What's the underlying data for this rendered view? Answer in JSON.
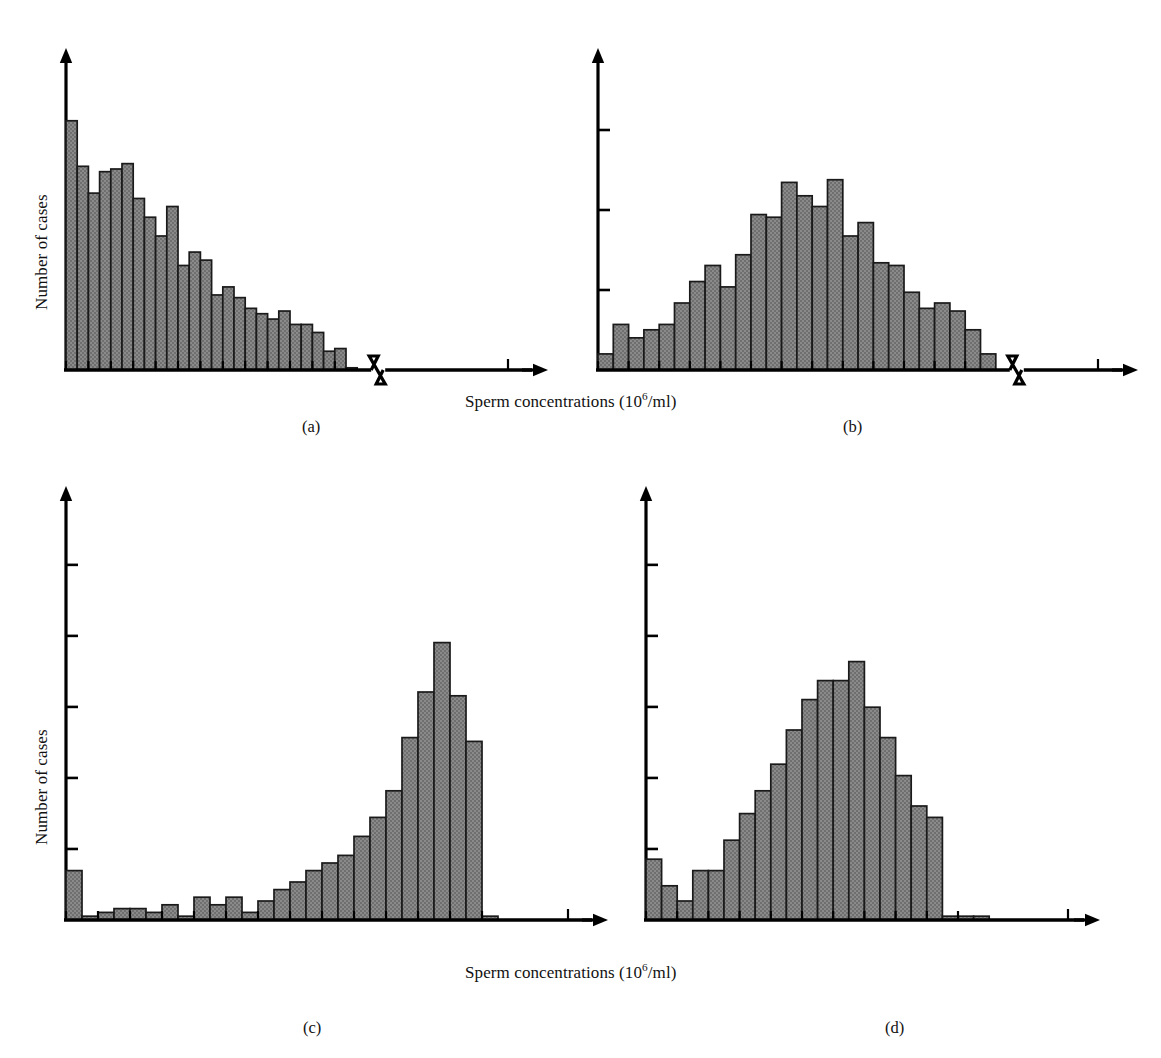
{
  "figure": {
    "axis_x_label_plain": "Sperm concentrations (10^6/ml)",
    "axis_x_label_main": "Sperm concentrations (10",
    "axis_x_label_sup": "6",
    "axis_x_label_tail": "/ml)",
    "axis_y_label": "Number of cases",
    "bar_fill_color": "#808080",
    "bar_edge_color": "#1a1a1a",
    "axis_color": "#000000",
    "background_color": "#ffffff"
  },
  "captions": {
    "a": "(a)",
    "b": "(b)",
    "c": "(c)",
    "d": "(d)"
  },
  "chart_data": [
    {
      "type": "bar",
      "panel": "a",
      "title": "",
      "xlabel": "Sperm concentrations (10^6/ml)",
      "ylabel": "Number of cases",
      "grid": false,
      "legend": "none",
      "axis_break": true,
      "n_bins": 26,
      "y_ticks_count": 3,
      "ylim": [
        0,
        100
      ],
      "description": "Right-skewed (positively skewed) distribution of sperm concentrations",
      "values": [
        93,
        76,
        66,
        74,
        75,
        77,
        64,
        57,
        50,
        61,
        39,
        44,
        41,
        28,
        31,
        27,
        23,
        21,
        19,
        22,
        17,
        17,
        14,
        7,
        8,
        0
      ]
    },
    {
      "type": "bar",
      "panel": "b",
      "title": "",
      "xlabel": "Sperm concentrations (10^6/ml)",
      "ylabel": "",
      "grid": false,
      "legend": "none",
      "axis_break": true,
      "n_bins": 26,
      "y_ticks_count": 3,
      "ylim": [
        0,
        100
      ],
      "description": "Approximately symmetric bell-shaped distribution after transformation",
      "values": [
        6,
        17,
        12,
        15,
        17,
        25,
        33,
        39,
        31,
        43,
        58,
        57,
        70,
        65,
        61,
        71,
        50,
        55,
        40,
        39,
        29,
        23,
        25,
        22,
        15,
        6
      ]
    },
    {
      "type": "bar",
      "panel": "c",
      "title": "",
      "xlabel": "Sperm concentrations (10^6/ml)",
      "ylabel": "Number of cases",
      "grid": false,
      "legend": "none",
      "axis_break": false,
      "n_bins": 27,
      "y_ticks_count": 5,
      "ylim": [
        0,
        100
      ],
      "description": "Strongly left-skewed (negatively skewed) distribution with a spike at the lowest bin",
      "values": [
        13,
        1,
        2,
        3,
        3,
        2,
        4,
        1,
        6,
        4,
        6,
        2,
        5,
        8,
        10,
        13,
        15,
        17,
        22,
        27,
        34,
        48,
        60,
        73,
        59,
        47,
        1
      ]
    },
    {
      "type": "bar",
      "panel": "d",
      "title": "",
      "xlabel": "Sperm concentrations (10^6/ml)",
      "ylabel": "",
      "grid": false,
      "legend": "none",
      "axis_break": false,
      "n_bins": 22,
      "y_ticks_count": 5,
      "ylim": [
        0,
        100
      ],
      "description": "Bell-shaped distribution with a small left shoulder and a flat zero tail at right",
      "values": [
        16,
        9,
        5,
        13,
        13,
        21,
        28,
        34,
        41,
        50,
        58,
        63,
        63,
        68,
        56,
        48,
        38,
        30,
        27,
        1,
        1,
        1
      ]
    }
  ]
}
